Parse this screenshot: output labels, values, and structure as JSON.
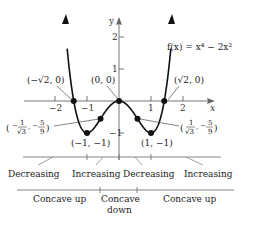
{
  "function_label": "f(x) = x⁴ − 2x²",
  "axes": {
    "x_label": "x",
    "y_label": "y",
    "x_ticks": [
      {
        "value": -2,
        "label": "−2"
      },
      {
        "value": -1,
        "label": "−1"
      },
      {
        "value": 1,
        "label": "1"
      },
      {
        "value": 2,
        "label": "2"
      }
    ],
    "y_ticks": [
      {
        "value": 1,
        "label": "1"
      },
      {
        "value": 2,
        "label": "2"
      },
      {
        "value": -1,
        "label": "−1"
      }
    ]
  },
  "points": [
    {
      "name": "neg-sqrt2-zero",
      "x": -1.4142,
      "y": 0,
      "label": "(−√2, 0)"
    },
    {
      "name": "origin",
      "x": 0,
      "y": 0,
      "label": "(0, 0)"
    },
    {
      "name": "sqrt2-zero",
      "x": 1.4142,
      "y": 0,
      "label": "(√2, 0)"
    },
    {
      "name": "neg-one-min",
      "x": -1,
      "y": -1,
      "label": "(−1, −1)"
    },
    {
      "name": "one-min",
      "x": 1,
      "y": -1,
      "label": "(1, −1)"
    },
    {
      "name": "neg-inflection",
      "x": -0.5774,
      "y": -0.5556,
      "label_num1": "1",
      "label_den1": "√3",
      "label_num2": "5",
      "label_den2": "9",
      "label_sign1": "−",
      "label_sign2": "−"
    },
    {
      "name": "pos-inflection",
      "x": 0.5774,
      "y": -0.5556,
      "label_num1": "1",
      "label_den1": "√3",
      "label_num2": "5",
      "label_den2": "9",
      "label_sign1": "",
      "label_sign2": "−"
    }
  ],
  "monotonicity": [
    "Decreasing",
    "Increasing",
    "Decreasing",
    "Increasing"
  ],
  "concavity": [
    "Concave up",
    "Concave",
    "down",
    "Concave up"
  ]
}
